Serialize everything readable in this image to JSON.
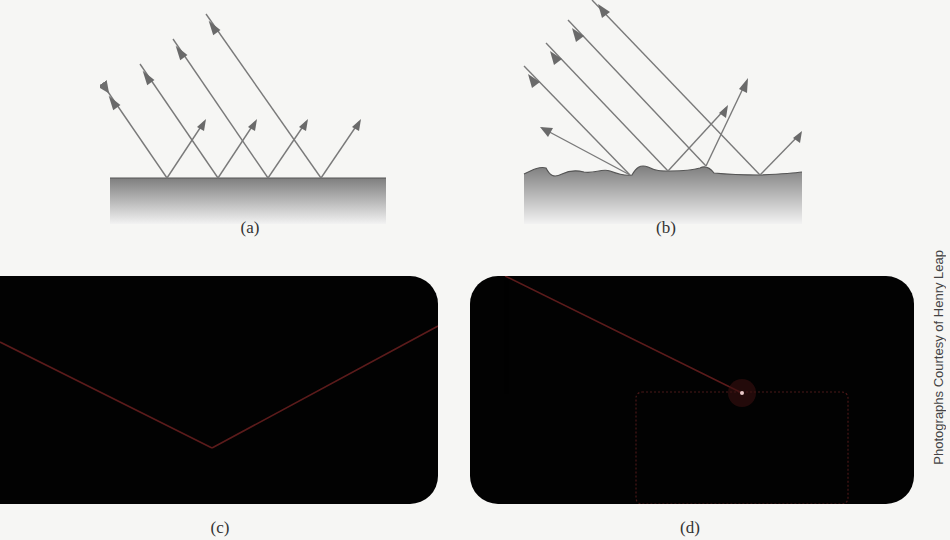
{
  "panels": {
    "a": {
      "label": "(a)",
      "description": "specular-reflection-smooth-surface"
    },
    "b": {
      "label": "(b)",
      "description": "diffuse-reflection-rough-surface"
    },
    "c": {
      "label": "(c)",
      "description": "photo-specular-reflection"
    },
    "d": {
      "label": "(d)",
      "description": "photo-diffuse-reflection"
    }
  },
  "credit": "Photographs Courtesy of Henry Leap",
  "colors": {
    "ray": "#777777",
    "surface_top": "#7a7a7a",
    "photo_bg": "#020202",
    "beam": "#6b1f1f"
  }
}
